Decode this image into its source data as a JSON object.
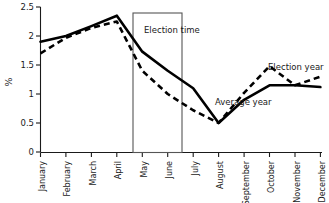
{
  "chart_data": {
    "type": "line",
    "title": "",
    "xlabel": "",
    "ylabel": "%",
    "ylim": [
      0,
      2.5
    ],
    "yticks": [
      "0",
      "0.5",
      "1",
      "1.5",
      "2",
      "2.5"
    ],
    "ytick_values": [
      0,
      0.5,
      1,
      1.5,
      2,
      2.5
    ],
    "grid": false,
    "legend_position": "inline-annotations",
    "categories": [
      "January",
      "February",
      "March",
      "April",
      "May",
      "June",
      "July",
      "August",
      "September",
      "October",
      "November",
      "December"
    ],
    "series": [
      {
        "name": "Average year",
        "style": "solid",
        "color": "#000000",
        "values": [
          1.9,
          2.0,
          2.17,
          2.35,
          1.73,
          1.4,
          1.1,
          0.5,
          0.9,
          1.15,
          1.15,
          1.12
        ]
      },
      {
        "name": "Election year",
        "style": "dashed",
        "color": "#000000",
        "values": [
          1.7,
          1.97,
          2.14,
          2.25,
          1.4,
          1.0,
          0.72,
          0.5,
          1.02,
          1.48,
          1.15,
          1.3
        ]
      }
    ],
    "annotations": [
      {
        "text": "Election time",
        "target": "box-region",
        "x_from": "May",
        "x_to": "June"
      },
      {
        "text": "Election year",
        "target": "dashed-series"
      },
      {
        "text": "Average year",
        "target": "solid-series"
      }
    ],
    "shaded_region": {
      "label": "Election time",
      "from": "May",
      "to": "June",
      "y_top": 2.4,
      "y_bottom": 0
    }
  }
}
